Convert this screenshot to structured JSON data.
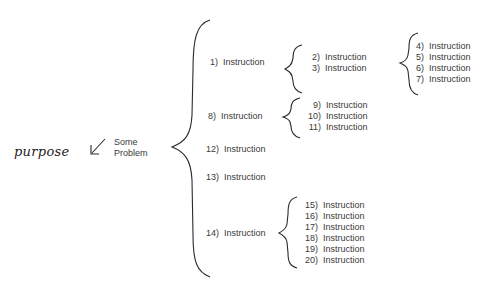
{
  "handwritten_label": "purpose",
  "root": {
    "text_line1": "Some",
    "text_line2": "Problem"
  },
  "level1": [
    {
      "num": "1)",
      "label": "Instruction"
    },
    {
      "num": "8)",
      "label": "Instruction"
    },
    {
      "num": "12)",
      "label": "Instruction"
    },
    {
      "num": "13)",
      "label": "Instruction"
    },
    {
      "num": "14)",
      "label": "Instruction"
    }
  ],
  "group_1": [
    {
      "num": "2)",
      "label": "Instruction"
    },
    {
      "num": "3)",
      "label": "Instruction"
    }
  ],
  "group_3": [
    {
      "num": "4)",
      "label": "Instruction"
    },
    {
      "num": "5)",
      "label": "Instruction"
    },
    {
      "num": "6)",
      "label": "Instruction"
    },
    {
      "num": "7)",
      "label": "Instruction"
    }
  ],
  "group_8": [
    {
      "num": "9)",
      "label": "Instruction"
    },
    {
      "num": "10)",
      "label": "Instruction"
    },
    {
      "num": "11)",
      "label": "Instruction"
    }
  ],
  "group_14": [
    {
      "num": "15)",
      "label": "Instruction"
    },
    {
      "num": "16)",
      "label": "Instruction"
    },
    {
      "num": "17)",
      "label": "Instruction"
    },
    {
      "num": "18)",
      "label": "Instruction"
    },
    {
      "num": "19)",
      "label": "Instruction"
    },
    {
      "num": "20)",
      "label": "Instruction"
    }
  ]
}
